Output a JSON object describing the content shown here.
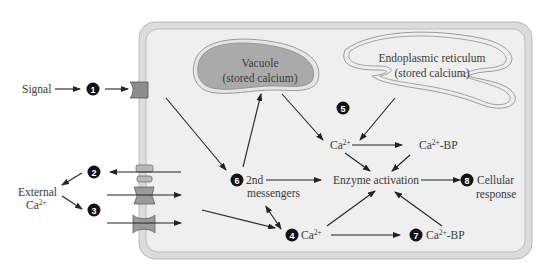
{
  "figure": {
    "signal_label": "Signal",
    "external_label_line1": "External",
    "external_label_line2": "Ca",
    "external_label_sup": "2+",
    "vacuole": {
      "line1": "Vacuole",
      "line2": "(stored calcium)"
    },
    "er": {
      "line1": "Endoplasmic reticulum",
      "line2": "(stored calcium)"
    },
    "ca_upper": {
      "base": "Ca",
      "sup": "2+"
    },
    "ca_bp_upper": {
      "base": "Ca",
      "sup": "2+",
      "suffix": "-BP"
    },
    "second_messengers": {
      "line1": "2nd",
      "line2": "messengers"
    },
    "enzyme_activation": "Enzyme activation",
    "cellular_response": {
      "line1": "Cellular",
      "line2": "response"
    },
    "ca_lower": {
      "base": "Ca",
      "sup": "2+"
    },
    "ca_bp_lower": {
      "base": "Ca",
      "sup": "2+",
      "suffix": "-BP"
    },
    "steps": [
      "1",
      "2",
      "3",
      "4",
      "5",
      "6",
      "7",
      "8"
    ]
  },
  "colors": {
    "cell_wall": "#d9d9d9",
    "cell_interior": "#eeeeee",
    "vacuole_fill": "#a9a9a9",
    "receptor": "#8c8c8c",
    "arrow": "#222222",
    "step_badge": "#111111"
  }
}
